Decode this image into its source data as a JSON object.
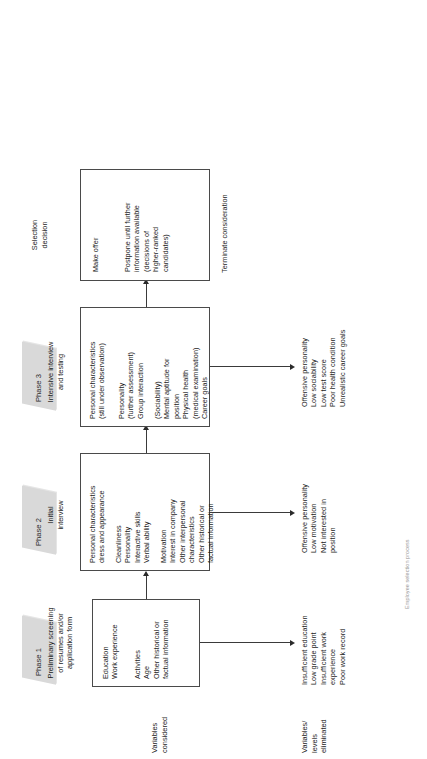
{
  "figure": {
    "orientation": "rotated-90-ccw",
    "caption": "Employee selection process"
  },
  "axis_labels": {
    "considered": "Variables\nconsidered",
    "eliminated": "Variables/\nlevels\neliminated"
  },
  "phases": [
    {
      "id": "phase-1",
      "banner": "Phase 1",
      "banner_label": "Preliminary screening\nof resumes and/or\napplication form",
      "box_groups": [
        "Education\nWork experience",
        "Activities\nAge\nOther historical or\n    factual information"
      ],
      "eliminated": "Insufficient education\nLow grade point\nInsufficient work\n    experience\nPoor work record"
    },
    {
      "id": "phase-2",
      "banner": "Phase 2",
      "banner_label": "Initial\ninterview",
      "box_groups": [
        "Personal characteristics\ndress and appearance",
        "Cleanliness\nPersonality\nInteractive skills\nVerbal ability",
        "Motivation\nInterest in company\nOther interpersonal\n    characteristics\nOther historical or\n    factual information"
      ],
      "eliminated": "Offensive personality\nLow motivation\nNot interested in\n    position"
    },
    {
      "id": "phase-3",
      "banner": "Phase 3",
      "banner_label": "Intensive interview\nand testing",
      "box_groups": [
        "Personal characteristics\n(still under observation)",
        "Personality\n    (further assessment)\nGroup interaction",
        "(Sociability)\nMental aptitude for\n    position\nPhysical health\n    (medical examination)\nCareer goals"
      ],
      "eliminated": "Offensive personality\nLow sociability\nLow test score\nPoor health condition\nUnrealistic career goals"
    }
  ],
  "decision": {
    "id": "selection-decision",
    "banner": "",
    "banner_label": "Selection\ndecision",
    "box_groups": [
      "Make offer",
      "Postpone until further\ninformation available\n(decisions of\nhigher-ranked\ncandidates)"
    ],
    "outside_label": "Terminate consideration"
  },
  "colors": {
    "banner_fill": "#d9d9d9",
    "box_stroke": "#4a4a4a",
    "text": "#1c1c1c",
    "connector": "#3a3a3a"
  }
}
